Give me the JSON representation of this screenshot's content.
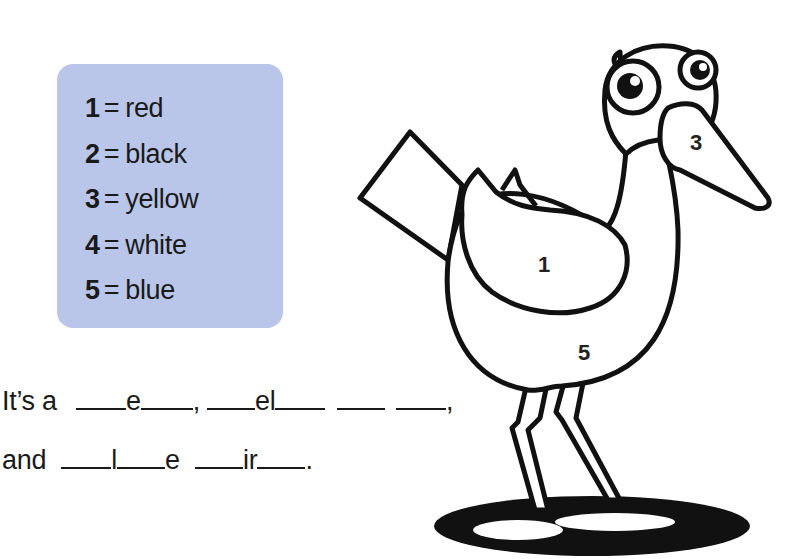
{
  "key": {
    "items": [
      {
        "number": "1",
        "color": "red"
      },
      {
        "number": "2",
        "color": "black"
      },
      {
        "number": "3",
        "color": "yellow"
      },
      {
        "number": "4",
        "color": "white"
      },
      {
        "number": "5",
        "color": "blue"
      }
    ],
    "equals": "=",
    "background": "#b9c6e9"
  },
  "sentences": {
    "line1": {
      "prefix": "It’s a",
      "word1_letter": "e",
      "comma1": ",",
      "word2_letter": "el",
      "comma2": ","
    },
    "line2": {
      "prefix": "and",
      "word3_letter1": "l",
      "word3_letter2": "e",
      "word4_letter": "ir",
      "period": "."
    }
  },
  "bird": {
    "labels": {
      "wing": "1",
      "beak": "3",
      "body": "5"
    }
  }
}
